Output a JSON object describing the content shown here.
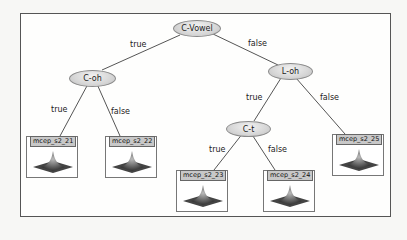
{
  "diagram": {
    "type": "decision-tree",
    "nodes": {
      "root": {
        "label": "C-Vowel"
      },
      "c_oh": {
        "label": "C-oh"
      },
      "l_oh": {
        "label": "L-oh"
      },
      "c_t": {
        "label": "C-t"
      }
    },
    "edges": {
      "root_true": "true",
      "root_false": "false",
      "coh_true": "true",
      "coh_false": "false",
      "loh_true": "true",
      "loh_false": "false",
      "ct_true": "true",
      "ct_false": "false"
    },
    "leaves": {
      "l21": {
        "label": "mcep_s2_21"
      },
      "l22": {
        "label": "mcep_s2_22"
      },
      "l23": {
        "label": "mcep_s2_23"
      },
      "l24": {
        "label": "mcep_s2_24"
      },
      "l25": {
        "label": "mcep_s2_25"
      }
    }
  }
}
